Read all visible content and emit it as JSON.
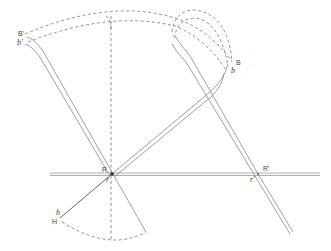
{
  "diagram": {
    "labels": {
      "B_prime": "B'",
      "b_prime": "b'",
      "B": "B",
      "b": "b",
      "R": "R",
      "r": "r",
      "R_prime": "R'",
      "r_prime": "r'",
      "H": "H",
      "h": "h"
    },
    "colors": {
      "line": "#8a8a8a",
      "dark_line": "#555555",
      "dash": "#777777",
      "text": "#444444"
    }
  }
}
